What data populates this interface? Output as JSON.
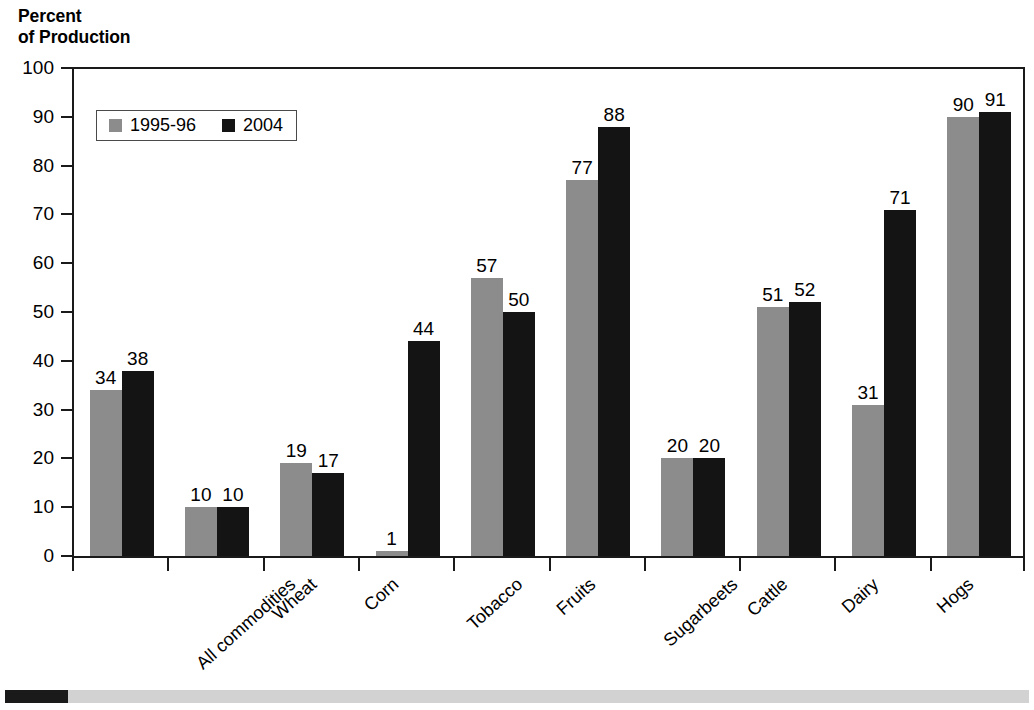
{
  "chart_data": {
    "type": "bar",
    "title": "Percent\nof Production",
    "xlabel": "",
    "ylabel": "Percent of Production",
    "ylim": [
      0,
      100
    ],
    "ytick_step": 10,
    "yticks": [
      100,
      90,
      80,
      70,
      60,
      50,
      40,
      30,
      20,
      10,
      0
    ],
    "grid": false,
    "legend_position": "upper-left-inside",
    "categories": [
      "All commodities",
      "Wheat",
      "Corn",
      "Tobacco",
      "Fruits",
      "Sugarbeets",
      "Cattle",
      "Dairy",
      "Hogs",
      "Poultry & eggs"
    ],
    "series": [
      {
        "name": "1995-96",
        "color": "#8c8c8c",
        "values": [
          34,
          10,
          19,
          1,
          57,
          77,
          20,
          51,
          31,
          90
        ]
      },
      {
        "name": "2004",
        "color": "#141414",
        "values": [
          38,
          10,
          17,
          44,
          50,
          88,
          20,
          52,
          71,
          91
        ]
      }
    ],
    "data_labels": true
  },
  "legend": {
    "items": [
      {
        "label": "1995-96",
        "color": "#8c8c8c"
      },
      {
        "label": "2004",
        "color": "#141414"
      }
    ]
  },
  "footer": {
    "accent_color": "#1a1a1a",
    "bar_color": "#d2d2d2"
  },
  "colors": {
    "axis": "#1a1a1a",
    "background": "#ffffff",
    "series_1995_96": "#8c8c8c",
    "series_2004": "#141414"
  }
}
